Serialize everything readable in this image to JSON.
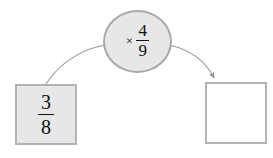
{
  "diagram": {
    "type": "fraction-multiplication-flow",
    "canvas": {
      "width": 273,
      "height": 158,
      "background": "#ffffff"
    },
    "stroke_color": "#9a9a9a",
    "fill_gray": "#e7e7e7",
    "border_gray": "#b3b3b3",
    "text_color": "#111111",
    "input_node": {
      "label": "3/8",
      "numerator": "3",
      "denominator": "8",
      "filled": true
    },
    "operator_node": {
      "symbol": "×",
      "label": "× 4/9",
      "numerator": "4",
      "denominator": "9"
    },
    "output_node": {
      "label": "",
      "filled": false
    },
    "arrows": [
      {
        "name": "input-to-operator",
        "has_arrowhead": false
      },
      {
        "name": "operator-to-output",
        "has_arrowhead": true
      }
    ]
  }
}
